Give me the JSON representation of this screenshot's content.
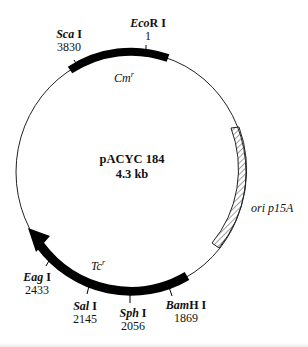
{
  "plasmid": {
    "name": "pACYC 184",
    "size": "4.3 kb"
  },
  "features": [
    {
      "name": "Cm",
      "superscript": "r",
      "type": "gene"
    },
    {
      "name": "Tc",
      "superscript": "r",
      "type": "gene"
    },
    {
      "name": "ori p15A",
      "type": "origin"
    }
  ],
  "sites": [
    {
      "italic": "Eco",
      "roman": "R I",
      "position": "1"
    },
    {
      "italic": "Sca",
      "roman": " I",
      "position": "3830"
    },
    {
      "italic": "Eag",
      "roman": " I",
      "position": "2433"
    },
    {
      "italic": "Sal",
      "roman": " I",
      "position": "2145"
    },
    {
      "italic": "Sph",
      "roman": " I",
      "position": "2056"
    },
    {
      "italic": "Bam",
      "roman": "H I",
      "position": "1869"
    }
  ]
}
